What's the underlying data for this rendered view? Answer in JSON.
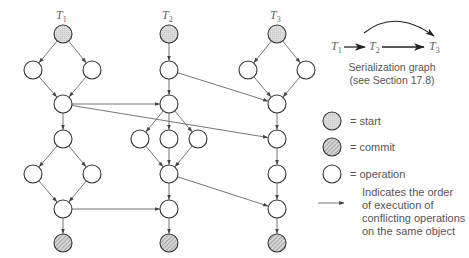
{
  "diagram": {
    "type": "transaction-dependency-graph",
    "transactions": [
      {
        "id": "T1",
        "name": "T",
        "sub": "1",
        "label_x": 56,
        "label_y": 8
      },
      {
        "id": "T2",
        "name": "T",
        "sub": "2",
        "label_x": 162,
        "label_y": 8
      },
      {
        "id": "T3",
        "name": "T",
        "sub": "3",
        "label_x": 270,
        "label_y": 8
      }
    ],
    "node_radius": 9,
    "nodes": [
      {
        "id": "t1s",
        "tx": "T1",
        "kind": "start",
        "x": 63,
        "y": 34
      },
      {
        "id": "t1a",
        "tx": "T1",
        "kind": "operation",
        "x": 33,
        "y": 70
      },
      {
        "id": "t1b",
        "tx": "T1",
        "kind": "operation",
        "x": 92,
        "y": 70
      },
      {
        "id": "t1c",
        "tx": "T1",
        "kind": "operation",
        "x": 63,
        "y": 104
      },
      {
        "id": "t1d",
        "tx": "T1",
        "kind": "operation",
        "x": 63,
        "y": 139
      },
      {
        "id": "t1e",
        "tx": "T1",
        "kind": "operation",
        "x": 33,
        "y": 174
      },
      {
        "id": "t1f",
        "tx": "T1",
        "kind": "operation",
        "x": 92,
        "y": 174
      },
      {
        "id": "t1g",
        "tx": "T1",
        "kind": "operation",
        "x": 63,
        "y": 209
      },
      {
        "id": "t1z",
        "tx": "T1",
        "kind": "commit",
        "x": 63,
        "y": 243
      },
      {
        "id": "t2s",
        "tx": "T2",
        "kind": "start",
        "x": 169,
        "y": 34
      },
      {
        "id": "t2a",
        "tx": "T2",
        "kind": "operation",
        "x": 169,
        "y": 70
      },
      {
        "id": "t2b",
        "tx": "T2",
        "kind": "operation",
        "x": 169,
        "y": 104
      },
      {
        "id": "t2c",
        "tx": "T2",
        "kind": "operation",
        "x": 140,
        "y": 139
      },
      {
        "id": "t2d",
        "tx": "T2",
        "kind": "operation",
        "x": 169,
        "y": 139
      },
      {
        "id": "t2e",
        "tx": "T2",
        "kind": "operation",
        "x": 198,
        "y": 139
      },
      {
        "id": "t2f",
        "tx": "T2",
        "kind": "operation",
        "x": 169,
        "y": 174
      },
      {
        "id": "t2g",
        "tx": "T2",
        "kind": "operation",
        "x": 169,
        "y": 209
      },
      {
        "id": "t2z",
        "tx": "T2",
        "kind": "commit",
        "x": 169,
        "y": 243
      },
      {
        "id": "t3s",
        "tx": "T3",
        "kind": "start",
        "x": 277,
        "y": 34
      },
      {
        "id": "t3a",
        "tx": "T3",
        "kind": "operation",
        "x": 248,
        "y": 70
      },
      {
        "id": "t3b",
        "tx": "T3",
        "kind": "operation",
        "x": 306,
        "y": 70
      },
      {
        "id": "t3c",
        "tx": "T3",
        "kind": "operation",
        "x": 277,
        "y": 104
      },
      {
        "id": "t3d",
        "tx": "T3",
        "kind": "operation",
        "x": 277,
        "y": 139
      },
      {
        "id": "t3e",
        "tx": "T3",
        "kind": "operation",
        "x": 277,
        "y": 174
      },
      {
        "id": "t3f",
        "tx": "T3",
        "kind": "operation",
        "x": 277,
        "y": 209
      },
      {
        "id": "t3z",
        "tx": "T3",
        "kind": "commit",
        "x": 277,
        "y": 243
      }
    ],
    "edges": [
      {
        "from": "t1s",
        "to": "t1a",
        "kind": "sequence"
      },
      {
        "from": "t1s",
        "to": "t1b",
        "kind": "sequence"
      },
      {
        "from": "t1a",
        "to": "t1c",
        "kind": "sequence"
      },
      {
        "from": "t1b",
        "to": "t1c",
        "kind": "sequence"
      },
      {
        "from": "t1c",
        "to": "t1d",
        "kind": "sequence"
      },
      {
        "from": "t1d",
        "to": "t1e",
        "kind": "sequence"
      },
      {
        "from": "t1d",
        "to": "t1f",
        "kind": "sequence"
      },
      {
        "from": "t1e",
        "to": "t1g",
        "kind": "sequence"
      },
      {
        "from": "t1f",
        "to": "t1g",
        "kind": "sequence"
      },
      {
        "from": "t1g",
        "to": "t1z",
        "kind": "sequence"
      },
      {
        "from": "t2s",
        "to": "t2a",
        "kind": "sequence"
      },
      {
        "from": "t2a",
        "to": "t2b",
        "kind": "sequence"
      },
      {
        "from": "t2b",
        "to": "t2c",
        "kind": "sequence"
      },
      {
        "from": "t2b",
        "to": "t2d",
        "kind": "sequence"
      },
      {
        "from": "t2b",
        "to": "t2e",
        "kind": "sequence"
      },
      {
        "from": "t2c",
        "to": "t2f",
        "kind": "sequence"
      },
      {
        "from": "t2d",
        "to": "t2f",
        "kind": "sequence"
      },
      {
        "from": "t2e",
        "to": "t2f",
        "kind": "sequence"
      },
      {
        "from": "t2f",
        "to": "t2g",
        "kind": "sequence"
      },
      {
        "from": "t2g",
        "to": "t2z",
        "kind": "sequence"
      },
      {
        "from": "t3s",
        "to": "t3a",
        "kind": "sequence"
      },
      {
        "from": "t3s",
        "to": "t3b",
        "kind": "sequence"
      },
      {
        "from": "t3a",
        "to": "t3c",
        "kind": "sequence"
      },
      {
        "from": "t3b",
        "to": "t3c",
        "kind": "sequence"
      },
      {
        "from": "t3c",
        "to": "t3d",
        "kind": "sequence"
      },
      {
        "from": "t3d",
        "to": "t3e",
        "kind": "sequence"
      },
      {
        "from": "t3e",
        "to": "t3f",
        "kind": "sequence"
      },
      {
        "from": "t3f",
        "to": "t3z",
        "kind": "sequence"
      },
      {
        "from": "t1c",
        "to": "t2b",
        "kind": "conflict"
      },
      {
        "from": "t1c",
        "to": "t3d",
        "kind": "conflict"
      },
      {
        "from": "t2a",
        "to": "t3c",
        "kind": "conflict"
      },
      {
        "from": "t1g",
        "to": "t2g",
        "kind": "conflict"
      },
      {
        "from": "t2f",
        "to": "t3f",
        "kind": "conflict"
      }
    ]
  },
  "serialization_graph": {
    "nodes": [
      {
        "name": "T",
        "sub": "1"
      },
      {
        "name": "T",
        "sub": "2"
      },
      {
        "name": "T",
        "sub": "3"
      }
    ],
    "caption_line1": "Serialization graph",
    "caption_line2": "(see Section 17.8)"
  },
  "legend": {
    "items": [
      {
        "kind": "start",
        "label": "= start"
      },
      {
        "kind": "commit",
        "label": "= commit"
      },
      {
        "kind": "operation",
        "label": "= operation"
      }
    ],
    "arrow_text_lines": [
      "Indicates the order",
      "of execution of",
      "conflicting operations",
      "on the same object"
    ]
  },
  "colors": {
    "stroke": "#333333",
    "edge": "#666666",
    "start_fill": "#d9d9d9",
    "commit_fill": "#cfcfcf",
    "operation_fill": "#ffffff",
    "text": "#555555"
  }
}
